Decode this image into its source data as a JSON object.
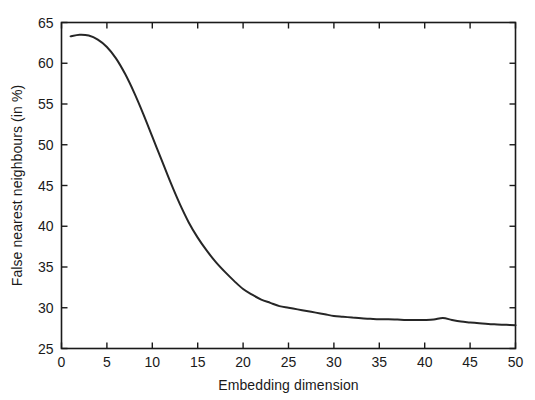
{
  "chart_data": {
    "type": "line",
    "title": "",
    "xlabel": "Embedding dimension",
    "ylabel": "False nearest neighbours (in %)",
    "xlim": [
      0,
      50
    ],
    "ylim": [
      25,
      65
    ],
    "xticks": [
      0,
      5,
      10,
      15,
      20,
      25,
      30,
      35,
      40,
      45,
      50
    ],
    "xtick_labels": [
      "0",
      "5",
      "10",
      "15",
      "20",
      "25",
      "30",
      "35",
      "40",
      "45",
      "50"
    ],
    "yticks": [
      25,
      30,
      35,
      40,
      45,
      50,
      55,
      60,
      65
    ],
    "ytick_labels": [
      "25",
      "30",
      "35",
      "40",
      "45",
      "50",
      "55",
      "60",
      "65"
    ],
    "grid": false,
    "legend": null,
    "legend_position": "none",
    "line_color": "#262626",
    "line_width": 2.0,
    "axis_color": "#1a1a1a",
    "background_color": "#ffffff",
    "x": [
      1,
      2,
      3,
      4,
      5,
      6,
      7,
      8,
      9,
      10,
      11,
      12,
      13,
      14,
      15,
      16,
      17,
      18,
      19,
      20,
      21,
      22,
      23,
      24,
      25,
      26,
      27,
      28,
      29,
      30,
      31,
      32,
      33,
      34,
      35,
      36,
      37,
      38,
      39,
      40,
      41,
      42,
      43,
      44,
      45,
      46,
      47,
      48,
      49,
      50
    ],
    "y": [
      63.3,
      63.5,
      63.4,
      62.9,
      62.0,
      60.6,
      58.7,
      56.4,
      53.8,
      51.0,
      48.2,
      45.4,
      42.8,
      40.5,
      38.6,
      37.0,
      35.6,
      34.4,
      33.3,
      32.3,
      31.6,
      31.0,
      30.6,
      30.2,
      30.0,
      29.8,
      29.6,
      29.4,
      29.2,
      29.0,
      28.9,
      28.8,
      28.7,
      28.65,
      28.6,
      28.6,
      28.55,
      28.5,
      28.5,
      28.5,
      28.55,
      28.75,
      28.5,
      28.3,
      28.2,
      28.1,
      28.0,
      27.95,
      27.9,
      27.85
    ]
  },
  "axes": {
    "x_label": "Embedding dimension",
    "y_label": "False nearest neighbours (in %)"
  }
}
